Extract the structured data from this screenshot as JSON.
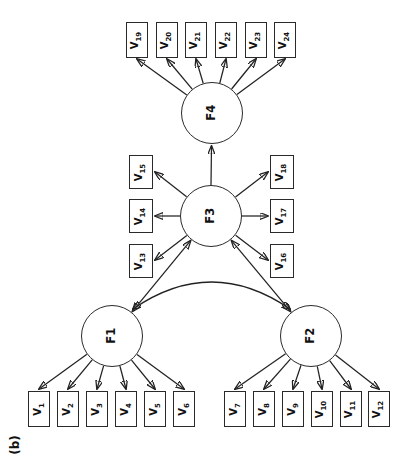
{
  "figure_label": "(b)",
  "factors": {
    "f1": "F1",
    "f2": "F2",
    "f3": "F3",
    "f4": "F4"
  },
  "indicators": {
    "base": "V",
    "f4_row": [
      "19",
      "20",
      "21",
      "22",
      "23",
      "24"
    ],
    "f3_left_col": [
      "15",
      "14",
      "13"
    ],
    "f3_right_col": [
      "18",
      "17",
      "16"
    ],
    "f1_row": [
      "1",
      "2",
      "3",
      "4",
      "5",
      "6"
    ],
    "f2_row": [
      "7",
      "8",
      "9",
      "10",
      "11",
      "12"
    ]
  },
  "relations": {
    "indicator_loadings": [
      [
        "F1",
        "V1-V6"
      ],
      [
        "F2",
        "V7-V12"
      ],
      [
        "F3",
        "V13-V18"
      ],
      [
        "F4",
        "V19-V24"
      ]
    ],
    "factor_regression": [
      [
        "F3",
        "F4"
      ]
    ],
    "factor_covariances": [
      [
        "F1",
        "F2"
      ],
      [
        "F1",
        "F3"
      ],
      [
        "F2",
        "F3"
      ]
    ]
  }
}
